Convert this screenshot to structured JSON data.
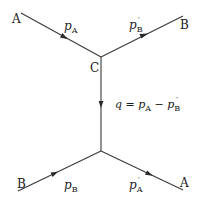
{
  "diagram": {
    "type": "feynman-diagram",
    "vertices": {
      "top": {
        "label": "C",
        "x": 101,
        "y": 57
      },
      "bottom": {
        "label": "",
        "x": 101,
        "y": 151
      }
    },
    "particles": {
      "top_left": "A",
      "top_right": "B",
      "bottom_left": "B",
      "bottom_right": "A"
    },
    "momenta": {
      "incoming_A": {
        "symbol": "p",
        "subscript": "A",
        "prime": false
      },
      "outgoing_B": {
        "symbol": "p",
        "subscript": "B",
        "prime": true
      },
      "incoming_B": {
        "symbol": "p",
        "subscript": "B",
        "prime": false
      },
      "outgoing_A": {
        "symbol": "p",
        "subscript": "A",
        "prime": true
      }
    },
    "exchange": {
      "q": "q",
      "eq": " = ",
      "p1": "p",
      "p1_sub": "A",
      "minus": " − ",
      "p2": "p",
      "p2_sub": "B",
      "prime": "′"
    },
    "prime_mark": "′",
    "line_color": "#3a3a3a"
  }
}
